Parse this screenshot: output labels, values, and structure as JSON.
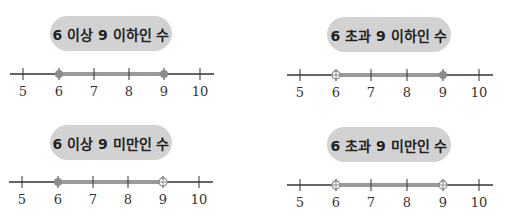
{
  "colors": {
    "axis": "#333333",
    "highlight": "#9a9a9a",
    "pill_bg": "#d2d2d2",
    "marker": "#8c8c8c"
  },
  "ticks": [
    "5",
    "6",
    "7",
    "8",
    "9",
    "10"
  ],
  "panels": [
    {
      "title": "6 이상 9 이하인 수",
      "range": {
        "from": 6,
        "to": 9,
        "from_closed": true,
        "to_closed": true
      }
    },
    {
      "title": "6 초과 9 이하인 수",
      "range": {
        "from": 6,
        "to": 9,
        "from_closed": false,
        "to_closed": true
      }
    },
    {
      "title": "6 이상 9 미만인 수",
      "range": {
        "from": 6,
        "to": 9,
        "from_closed": true,
        "to_closed": false
      }
    },
    {
      "title": "6 초과 9 미만인 수",
      "range": {
        "from": 6,
        "to": 9,
        "from_closed": false,
        "to_closed": false
      }
    }
  ]
}
